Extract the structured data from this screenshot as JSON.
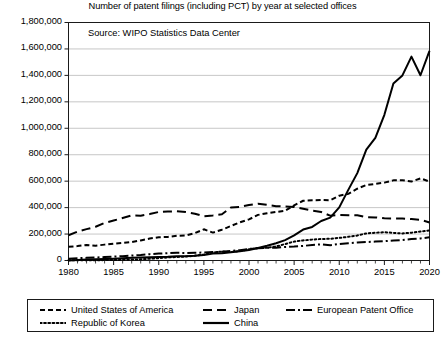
{
  "chart_data": {
    "type": "line",
    "title": "Number of patent filings (including PCT) by year at selected offices",
    "annotation": "Source: WIPO Statistics Data Center",
    "xlabel": "",
    "ylabel": "",
    "xlim": [
      1980,
      2020
    ],
    "ylim": [
      0,
      1800000
    ],
    "grid": true,
    "legend_position": "bottom",
    "x_ticks": [
      1980,
      1985,
      1990,
      1995,
      2000,
      2005,
      2010,
      2015,
      2020
    ],
    "x_tick_labels": [
      "1980",
      "1985",
      "1990",
      "1995",
      "2000",
      "2005",
      "2010",
      "2015",
      "2020"
    ],
    "x_minor_tick_step": 1,
    "y_ticks": [
      0,
      200000,
      400000,
      600000,
      800000,
      1000000,
      1200000,
      1400000,
      1600000,
      1800000
    ],
    "y_tick_labels": [
      "0",
      "200,000",
      "400,000",
      "600,000",
      "800,000",
      "1,000,000",
      "1,200,000",
      "1,400,000",
      "1,600,000",
      "1,800,000"
    ],
    "x": [
      1980,
      1981,
      1982,
      1983,
      1984,
      1985,
      1986,
      1987,
      1988,
      1989,
      1990,
      1991,
      1992,
      1993,
      1994,
      1995,
      1996,
      1997,
      1998,
      1999,
      2000,
      2001,
      2002,
      2003,
      2004,
      2005,
      2006,
      2007,
      2008,
      2009,
      2010,
      2011,
      2012,
      2013,
      2014,
      2015,
      2016,
      2017,
      2018,
      2019,
      2020
    ],
    "series": [
      {
        "name": "United States of America",
        "style": "short-dash",
        "color": "#000000",
        "values": [
          104000,
          109000,
          118000,
          112000,
          120000,
          127000,
          133000,
          140000,
          152000,
          166000,
          176000,
          178000,
          187000,
          190000,
          207000,
          236000,
          211000,
          233000,
          261000,
          289000,
          311000,
          345000,
          357000,
          367000,
          376000,
          417000,
          452000,
          456000,
          457000,
          456000,
          490000,
          504000,
          543000,
          571000,
          579000,
          589000,
          606000,
          607000,
          597000,
          621000,
          597000
        ]
      },
      {
        "name": "Japan",
        "style": "long-dash",
        "color": "#000000",
        "values": [
          191000,
          218000,
          237000,
          255000,
          284000,
          302000,
          321000,
          341000,
          339000,
          351000,
          367000,
          370000,
          372000,
          366000,
          354000,
          335000,
          341000,
          350000,
          401000,
          405000,
          420000,
          430000,
          421000,
          411000,
          408000,
          405000,
          391000,
          377000,
          367000,
          339000,
          345000,
          343000,
          342000,
          328000,
          326000,
          319000,
          318000,
          318000,
          313000,
          308000,
          288000
        ]
      },
      {
        "name": "European Patent Office",
        "style": "dash-dot",
        "color": "#000000",
        "values": [
          14000,
          17000,
          20000,
          23000,
          26000,
          30000,
          33000,
          38000,
          42000,
          48000,
          52000,
          55000,
          58000,
          57000,
          59000,
          60000,
          64000,
          66000,
          73000,
          78000,
          88000,
          93000,
          96000,
          97000,
          102000,
          105000,
          110000,
          118000,
          122000,
          115000,
          125000,
          131000,
          136000,
          140000,
          143000,
          146000,
          151000,
          155000,
          162000,
          167000,
          175000
        ]
      },
      {
        "name": "Republic of Korea",
        "style": "dotted",
        "color": "#000000",
        "values": [
          1300,
          1500,
          1800,
          2200,
          3000,
          4000,
          5000,
          7000,
          9000,
          13000,
          18000,
          23000,
          27000,
          30000,
          36000,
          45000,
          60000,
          68000,
          64000,
          72000,
          85000,
          94000,
          97000,
          106000,
          124000,
          143000,
          152000,
          158000,
          163000,
          164000,
          171000,
          179000,
          189000,
          205000,
          210000,
          214000,
          209000,
          205000,
          210000,
          219000,
          227000
        ]
      },
      {
        "name": "China",
        "style": "solid",
        "color": "#000000",
        "values": [
          0,
          4000,
          7000,
          9000,
          11000,
          14000,
          17000,
          20000,
          22000,
          24000,
          26000,
          28000,
          32000,
          33000,
          36000,
          41000,
          52000,
          54000,
          62000,
          70000,
          79000,
          95000,
          111000,
          130000,
          154000,
          190000,
          234000,
          254000,
          299000,
          324000,
          402000,
          534000,
          661000,
          838000,
          928000,
          1102000,
          1339000,
          1400000,
          1542000,
          1401000,
          1586000
        ]
      }
    ]
  },
  "legend": {
    "items": [
      {
        "label": "United States of America",
        "style": "short-dash"
      },
      {
        "label": "Japan",
        "style": "long-dash"
      },
      {
        "label": "European Patent Office",
        "style": "dash-dot"
      },
      {
        "label": "Republic of Korea",
        "style": "dotted"
      },
      {
        "label": "China",
        "style": "solid"
      }
    ]
  }
}
